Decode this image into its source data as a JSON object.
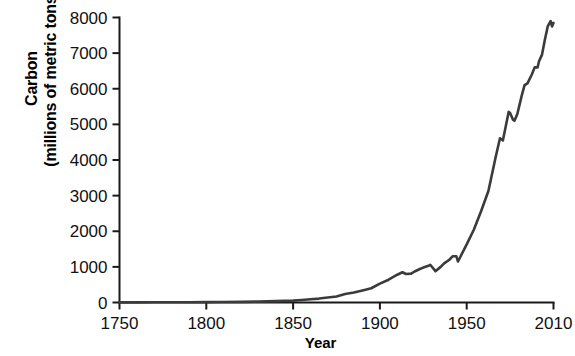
{
  "chart_data": {
    "type": "line",
    "title": "",
    "xlabel": "Year",
    "ylabel": "Carbon (millions of metric tons)",
    "ylabel_line1": "Carbon",
    "ylabel_line2": "(millions of metric tons)",
    "xlim": [
      1750,
      2010
    ],
    "ylim": [
      0,
      8000
    ],
    "xticks": [
      1750,
      1800,
      1850,
      1900,
      1950,
      2010
    ],
    "xtick_labels": [
      "1750",
      "1800",
      "1850",
      "1900",
      "1950",
      "2010"
    ],
    "yticks": [
      0,
      1000,
      2000,
      3000,
      4000,
      5000,
      6000,
      7000,
      8000
    ],
    "ytick_labels": [
      "0",
      "1000",
      "2000",
      "3000",
      "4000",
      "5000",
      "6000",
      "7000",
      "8000"
    ],
    "grid": false,
    "legend": null,
    "line_color": "#3b3b3b",
    "series": [
      {
        "name": "Global carbon emissions from fossil fuels",
        "x": [
          1750,
          1760,
          1770,
          1780,
          1790,
          1800,
          1810,
          1820,
          1830,
          1840,
          1850,
          1855,
          1860,
          1865,
          1870,
          1875,
          1880,
          1885,
          1890,
          1895,
          1900,
          1905,
          1910,
          1913,
          1915,
          1918,
          1920,
          1923,
          1925,
          1928,
          1929,
          1932,
          1935,
          1937,
          1940,
          1942,
          1944,
          1945,
          1946,
          1950,
          1955,
          1960,
          1965,
          1970,
          1973,
          1975,
          1979,
          1980,
          1982,
          1983,
          1985,
          1988,
          1990,
          1992,
          1995,
          1997,
          1999,
          2000,
          2002,
          2004,
          2006,
          2008,
          2009,
          2010
        ],
        "values": [
          3,
          4,
          5,
          6,
          8,
          10,
          14,
          18,
          25,
          38,
          54,
          70,
          90,
          110,
          140,
          170,
          240,
          280,
          340,
          400,
          530,
          640,
          780,
          850,
          800,
          810,
          870,
          940,
          980,
          1030,
          1060,
          880,
          1000,
          1100,
          1200,
          1300,
          1300,
          1150,
          1250,
          1630,
          2050,
          2570,
          3130,
          4080,
          4610,
          4550,
          5350,
          5320,
          5130,
          5100,
          5290,
          5800,
          6100,
          6150,
          6400,
          6600,
          6600,
          6770,
          6950,
          7370,
          7750,
          7900,
          7750,
          7850
        ],
        "data_points_description": "Monotone rise near zero from 1750 to ~1850; gradual increase to ~850 by 1913; WWI dip, 1920s recovery, Great Depression dip ~1932, WWII fluctuations; sharp post-1950 acceleration; plateaus in early 1980s and late 1990s; peak ~7900 near 2008 with small dip in 2009."
      }
    ]
  },
  "axis": {
    "y_tick_count": 9,
    "x_tick_count": 6
  }
}
